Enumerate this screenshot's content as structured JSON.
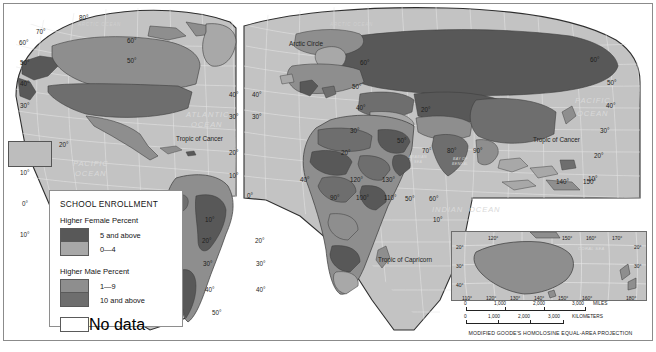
{
  "map": {
    "projection_note": "MODIFIED GOODE'S HOMOLOSINE EQUAL-AREA PROJECTION",
    "ocean_labels": [
      {
        "text": "ARCTIC OCEAN",
        "x": 78,
        "y": 26
      },
      {
        "text": "ARCTIC OCEAN",
        "x": 330,
        "y": 26
      },
      {
        "text": "ATLANTIC",
        "x": 186,
        "y": 117
      },
      {
        "text": "OCEAN",
        "x": 191,
        "y": 127
      },
      {
        "text": "PACIFIC",
        "x": 73,
        "y": 166
      },
      {
        "text": "OCEAN",
        "x": 75,
        "y": 176
      },
      {
        "text": "PACIFIC",
        "x": 575,
        "y": 103
      },
      {
        "text": "OCEAN",
        "x": 577,
        "y": 116
      },
      {
        "text": "INDIAN",
        "x": 432,
        "y": 212
      },
      {
        "text": "OCEAN",
        "x": 469,
        "y": 212
      }
    ],
    "sea_labels": [
      {
        "text": "ARABIAN",
        "x": 409,
        "y": 158
      },
      {
        "text": "SEA",
        "x": 414,
        "y": 163
      },
      {
        "text": "BAY OF",
        "x": 453,
        "y": 160
      },
      {
        "text": "BENGAL",
        "x": 452,
        "y": 165
      },
      {
        "text": "CORAL SEA",
        "x": 570,
        "y": 247
      }
    ],
    "reference_lines": [
      {
        "text": "Arctic Circle",
        "x": 289,
        "y": 46
      },
      {
        "text": "Tropic of Cancer",
        "x": 176,
        "y": 141
      },
      {
        "text": "Tropic of Cancer",
        "x": 533,
        "y": 142
      },
      {
        "text": "Tropic of Capricorn",
        "x": 378,
        "y": 262
      }
    ],
    "latitude_labels_left_lobe": [
      "80",
      "70",
      "60",
      "50",
      "40",
      "30",
      "20",
      "10",
      "0",
      "10"
    ],
    "latitude_labels": [
      "80",
      "70",
      "60",
      "50",
      "40",
      "30",
      "20",
      "10",
      "0"
    ],
    "longitude_labels_equator": [
      "0",
      "50",
      "60"
    ],
    "longitude_labels_lower": [
      "140",
      "150",
      "160"
    ],
    "grid_labels": [
      {
        "text": "80",
        "x": 79,
        "y": 20
      },
      {
        "text": "70",
        "x": 36,
        "y": 34
      },
      {
        "text": "60",
        "x": 19,
        "y": 45
      },
      {
        "text": "60",
        "x": 127,
        "y": 43
      },
      {
        "text": "50",
        "x": 20,
        "y": 65
      },
      {
        "text": "50",
        "x": 127,
        "y": 63
      },
      {
        "text": "40",
        "x": 20,
        "y": 86
      },
      {
        "text": "40",
        "x": 229,
        "y": 97
      },
      {
        "text": "40",
        "x": 252,
        "y": 97
      },
      {
        "text": "30",
        "x": 20,
        "y": 108
      },
      {
        "text": "30",
        "x": 229,
        "y": 119
      },
      {
        "text": "30",
        "x": 252,
        "y": 119
      },
      {
        "text": "20",
        "x": 59,
        "y": 147
      },
      {
        "text": "20",
        "x": 229,
        "y": 155
      },
      {
        "text": "160",
        "x": 16,
        "y": 159
      },
      {
        "text": "10",
        "x": 20,
        "y": 175
      },
      {
        "text": "10",
        "x": 229,
        "y": 178
      },
      {
        "text": "0",
        "x": 22,
        "y": 206
      },
      {
        "text": "0",
        "x": 247,
        "y": 198
      },
      {
        "text": "10",
        "x": 20,
        "y": 237
      },
      {
        "text": "10",
        "x": 205,
        "y": 222
      },
      {
        "text": "20",
        "x": 202,
        "y": 243
      },
      {
        "text": "20",
        "x": 255,
        "y": 243
      },
      {
        "text": "30",
        "x": 203,
        "y": 266
      },
      {
        "text": "30",
        "x": 256,
        "y": 266
      },
      {
        "text": "40",
        "x": 205,
        "y": 292
      },
      {
        "text": "40",
        "x": 256,
        "y": 292
      },
      {
        "text": "50",
        "x": 212,
        "y": 315
      },
      {
        "text": "50",
        "x": 397,
        "y": 143
      },
      {
        "text": "50",
        "x": 405,
        "y": 201
      },
      {
        "text": "60",
        "x": 429,
        "y": 201
      },
      {
        "text": "70",
        "x": 422,
        "y": 153
      },
      {
        "text": "80",
        "x": 447,
        "y": 153
      },
      {
        "text": "90",
        "x": 473,
        "y": 153
      },
      {
        "text": "10",
        "x": 433,
        "y": 222
      },
      {
        "text": "10",
        "x": 588,
        "y": 181
      },
      {
        "text": "20",
        "x": 594,
        "y": 158
      },
      {
        "text": "30",
        "x": 600,
        "y": 133
      },
      {
        "text": "40",
        "x": 606,
        "y": 108
      },
      {
        "text": "50",
        "x": 607,
        "y": 85
      },
      {
        "text": "60",
        "x": 590,
        "y": 62
      },
      {
        "text": "60",
        "x": 360,
        "y": 65
      },
      {
        "text": "50",
        "x": 352,
        "y": 89
      },
      {
        "text": "40",
        "x": 356,
        "y": 110
      },
      {
        "text": "30",
        "x": 350,
        "y": 133
      },
      {
        "text": "20",
        "x": 341,
        "y": 155
      },
      {
        "text": "140",
        "x": 556,
        "y": 184
      },
      {
        "text": "150",
        "x": 583,
        "y": 184
      },
      {
        "text": "120",
        "x": 350,
        "y": 182
      },
      {
        "text": "130",
        "x": 382,
        "y": 182
      },
      {
        "text": "20",
        "x": 421,
        "y": 112
      },
      {
        "text": "40",
        "x": 300,
        "y": 182
      },
      {
        "text": "90",
        "x": 330,
        "y": 200
      },
      {
        "text": "100",
        "x": 356,
        "y": 200
      },
      {
        "text": "110",
        "x": 384,
        "y": 200
      }
    ]
  },
  "legend": {
    "title": "SCHOOL ENROLLMENT",
    "section_female": "Higher Female Percent",
    "section_male": "Higher Male Percent",
    "items_female": [
      {
        "label": "5 and above",
        "color": "#585858"
      },
      {
        "label": "0—4",
        "color": "#a8a8a8"
      }
    ],
    "items_male": [
      {
        "label": "1—9",
        "color": "#8e8e8e"
      },
      {
        "label": "10 and above",
        "color": "#6e6e6e"
      }
    ],
    "item_nodata": {
      "label": "No data",
      "color": "#ffffff"
    }
  },
  "inset": {
    "name": "australia-new-zealand-inset",
    "longitude_top": [
      "120",
      "150",
      "160",
      "170"
    ],
    "longitude_bottom": [
      "110",
      "120",
      "130",
      "140",
      "150",
      "160",
      "180"
    ],
    "latitude_left": [
      "20",
      "30",
      "40"
    ],
    "latitude_right": [
      "20",
      "30"
    ],
    "sea_label": "CORAL SEA"
  },
  "scale_miles": {
    "ticks": [
      "0",
      "1,000",
      "2,000",
      "3,000"
    ],
    "unit": "MILES"
  },
  "scale_km": {
    "ticks": [
      "0",
      "1,000",
      "2,000",
      "3,000"
    ],
    "unit": "KILOMETERS"
  },
  "colors": {
    "ocean": "#c3c3c3",
    "graticule": "#e8e8e8",
    "land_light": "#a8a8a8",
    "land_mid": "#8e8e8e",
    "land_dark": "#6e6e6e",
    "land_darkest": "#585858",
    "outline": "#3a3a3a",
    "frame": "#8b8b8b"
  }
}
